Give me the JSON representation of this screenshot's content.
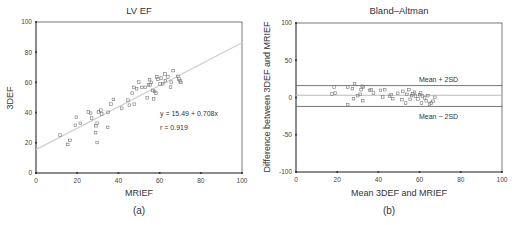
{
  "chart_data": [
    {
      "id": "a",
      "type": "scatter",
      "title": "LV EF",
      "caption": "(a)",
      "xlabel": "MRIEF",
      "ylabel": "3DEF",
      "xlim": [
        0,
        100
      ],
      "ylim": [
        0,
        100
      ],
      "xticks": [
        0,
        20,
        40,
        60,
        80,
        100
      ],
      "yticks": [
        0,
        20,
        40,
        60,
        80,
        100
      ],
      "grid": false,
      "regression": {
        "intercept": 15.49,
        "slope": 0.708,
        "equation_text": "y = 15.49 + 0.708x",
        "r_text": "r = 0.919"
      },
      "points": [
        [
          11.7,
          25.1
        ],
        [
          15.4,
          18.9
        ],
        [
          16.5,
          21.6
        ],
        [
          19.6,
          36.9
        ],
        [
          19.1,
          31.6
        ],
        [
          21.5,
          32.9
        ],
        [
          25.4,
          40.4
        ],
        [
          26.5,
          39.6
        ],
        [
          27.0,
          36.4
        ],
        [
          28.9,
          26.7
        ],
        [
          29.1,
          31.3
        ],
        [
          29.7,
          32.9
        ],
        [
          29.7,
          20.2
        ],
        [
          30.3,
          40.4
        ],
        [
          31.5,
          41.6
        ],
        [
          31.9,
          39.1
        ],
        [
          34.8,
          30.2
        ],
        [
          35.0,
          40.2
        ],
        [
          36.4,
          45.6
        ],
        [
          37.6,
          48.7
        ],
        [
          41.6,
          42.9
        ],
        [
          44.6,
          48.2
        ],
        [
          45.3,
          44.9
        ],
        [
          46.7,
          52.9
        ],
        [
          47.5,
          56.7
        ],
        [
          47.7,
          45.6
        ],
        [
          48.8,
          55.8
        ],
        [
          49.9,
          60.2
        ],
        [
          51.4,
          56.7
        ],
        [
          53.0,
          56.7
        ],
        [
          54.0,
          49.8
        ],
        [
          54.6,
          58.4
        ],
        [
          55.1,
          61.8
        ],
        [
          55.4,
          58.4
        ],
        [
          56.0,
          60.0
        ],
        [
          56.7,
          54.7
        ],
        [
          57.1,
          49.1
        ],
        [
          57.6,
          54.0
        ],
        [
          58.2,
          52.9
        ],
        [
          58.7,
          63.6
        ],
        [
          59.2,
          62.2
        ],
        [
          60.2,
          58.9
        ],
        [
          60.8,
          62.9
        ],
        [
          61.5,
          59.1
        ],
        [
          62.6,
          65.6
        ],
        [
          62.8,
          61.1
        ],
        [
          64.0,
          63.6
        ],
        [
          65.3,
          56.9
        ],
        [
          65.7,
          60.2
        ],
        [
          66.6,
          67.8
        ],
        [
          68.9,
          64.0
        ],
        [
          69.4,
          62.2
        ],
        [
          69.9,
          61.1
        ],
        [
          70.3,
          60.0
        ]
      ]
    },
    {
      "id": "b",
      "type": "scatter",
      "title": "Bland–Altman",
      "caption": "(b)",
      "xlabel": "Mean 3DEF and MRIEF",
      "ylabel": "Difference between 3DEF and MRIEF",
      "xlim": [
        0,
        100
      ],
      "ylim": [
        -100,
        100
      ],
      "xticks": [
        0,
        20,
        40,
        60,
        80,
        100
      ],
      "yticks": [
        -100,
        -50,
        0,
        50,
        100
      ],
      "grid": false,
      "reference_lines": [
        {
          "label": "Mean + 2SD",
          "y": 16
        },
        {
          "label": "Mean",
          "y": 3
        },
        {
          "label": "Mean − 2SD",
          "y": -12
        }
      ],
      "points": [
        [
          17.5,
          4.7
        ],
        [
          18.5,
          14.1
        ],
        [
          19.1,
          6.0
        ],
        [
          25.1,
          14.1
        ],
        [
          25.1,
          -9.6
        ],
        [
          27.4,
          11.9
        ],
        [
          27.9,
          -1.6
        ],
        [
          28.4,
          18.6
        ],
        [
          30.0,
          2.5
        ],
        [
          31.1,
          4.3
        ],
        [
          31.6,
          10.5
        ],
        [
          32.1,
          15.0
        ],
        [
          32.7,
          14.1
        ],
        [
          32.4,
          -4.3
        ],
        [
          35.7,
          9.6
        ],
        [
          36.5,
          10.5
        ],
        [
          37.6,
          6.0
        ],
        [
          41.0,
          9.6
        ],
        [
          42.1,
          0.7
        ],
        [
          43.1,
          10.5
        ],
        [
          45.4,
          1.6
        ],
        [
          46.2,
          3.8
        ],
        [
          47.0,
          -1.6
        ],
        [
          49.4,
          5.6
        ],
        [
          51.4,
          -2.9
        ],
        [
          51.9,
          8.3
        ],
        [
          53.2,
          -7.4
        ],
        [
          53.8,
          4.3
        ],
        [
          54.8,
          10.5
        ],
        [
          55.4,
          -2.5
        ],
        [
          56.1,
          2.5
        ],
        [
          56.7,
          5.1
        ],
        [
          57.5,
          7.0
        ],
        [
          58.0,
          2.0
        ],
        [
          59.2,
          -2.0
        ],
        [
          60.0,
          3.8
        ],
        [
          60.5,
          6.0
        ],
        [
          60.9,
          -7.4
        ],
        [
          61.4,
          2.0
        ],
        [
          62.4,
          -0.7
        ],
        [
          63.2,
          -4.3
        ],
        [
          64.0,
          2.5
        ],
        [
          64.8,
          -8.7
        ],
        [
          65.6,
          -7.4
        ],
        [
          66.5,
          -5.1
        ],
        [
          67.4,
          0.2
        ]
      ]
    }
  ]
}
